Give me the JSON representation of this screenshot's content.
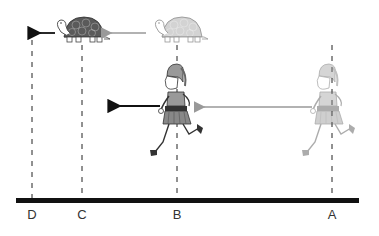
{
  "diagram": {
    "points": [
      {
        "label": "D",
        "x": 32
      },
      {
        "label": "C",
        "x": 82
      },
      {
        "label": "B",
        "x": 177
      },
      {
        "label": "A",
        "x": 332
      }
    ],
    "ground": {
      "x1": 16,
      "x2": 359,
      "y": 201,
      "color": "#111111"
    },
    "tortoises": [
      {
        "state": "current",
        "x": 57,
        "y": 18,
        "color": "#555555",
        "at": "C"
      },
      {
        "state": "previous",
        "x": 150,
        "y": 18,
        "color": "#aaaaaa",
        "at": "B"
      }
    ],
    "runners": [
      {
        "state": "current",
        "x": 148,
        "y": 62,
        "at": "B"
      },
      {
        "state": "previous",
        "x": 300,
        "y": 62,
        "at": "A",
        "faded": true
      }
    ],
    "arrows": [
      {
        "name": "tortoise-next-arrow",
        "x1": 55,
        "x2": 33,
        "y": 33,
        "color": "#111111"
      },
      {
        "name": "tortoise-prev-arrow",
        "x1": 146,
        "x2": 104,
        "y": 33,
        "color": "#999999"
      },
      {
        "name": "runner-next-arrow",
        "x1": 160,
        "x2": 113,
        "y": 106,
        "color": "#111111"
      },
      {
        "name": "runner-prev-arrow",
        "x1": 312,
        "x2": 197,
        "y": 107,
        "color": "#999999"
      }
    ],
    "labels": {
      "D": "D",
      "C": "C",
      "B": "B",
      "A": "A"
    }
  }
}
